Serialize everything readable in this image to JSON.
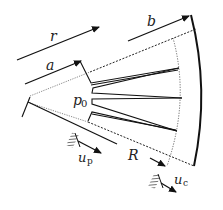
{
  "diagram": {
    "type": "wedge-section schematic",
    "labels": {
      "r": "r",
      "a": "a",
      "b": "b",
      "R": "R",
      "p0_main": "p",
      "p0_sub": "0",
      "up_main": "u",
      "up_sub": "p",
      "uc_main": "u",
      "uc_sub": "c"
    },
    "colors": {
      "stroke": "#111111",
      "dotted": "#333333",
      "background": "#ffffff"
    },
    "elements": [
      {
        "name": "radial-arrow-r",
        "label": "r"
      },
      {
        "name": "radial-arrow-a",
        "label": "a"
      },
      {
        "name": "radial-arrow-b",
        "label": "b"
      },
      {
        "name": "radial-arrow-R",
        "label": "R"
      },
      {
        "name": "inner-pressure",
        "label": "p0"
      },
      {
        "name": "displacement-arrow-up",
        "label": "u_p"
      },
      {
        "name": "displacement-arrow-uc",
        "label": "u_c"
      },
      {
        "name": "outer-boundary-arc",
        "label": "radius b"
      },
      {
        "name": "dotted-boundary-arc",
        "label": "radius R"
      },
      {
        "name": "radial-cracks",
        "count": 3
      }
    ]
  }
}
